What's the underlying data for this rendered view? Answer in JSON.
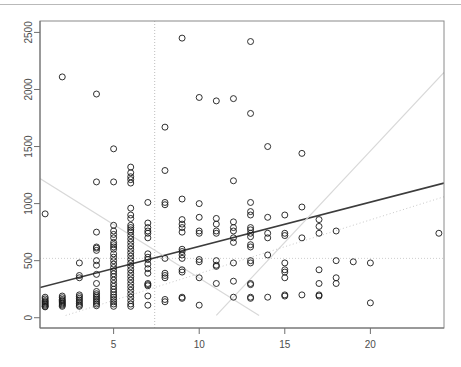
{
  "figure": {
    "kind": "scatter-plot",
    "background": "#ffffff",
    "top_separator_color": "#b9b9b9"
  },
  "chart_data": {
    "type": "scatter",
    "title": "",
    "subtitle": "",
    "xlabel": "",
    "ylabel": "",
    "xlim": [
      0.7,
      24.3
    ],
    "ylim": [
      -90,
      2600
    ],
    "xticks": [
      5,
      10,
      15,
      20
    ],
    "yticks": [
      0,
      500,
      1000,
      1500,
      2000,
      2500
    ],
    "xtick_labels": [
      "5",
      "10",
      "15",
      "20"
    ],
    "ytick_labels": [
      "0",
      "500",
      "1000",
      "1500",
      "2000",
      "2500"
    ],
    "ytick_label_rotation": -90,
    "grid": false,
    "legend": null,
    "marker": {
      "shape": "open-circle",
      "color": "#1a1a1a",
      "radius": 3.0
    },
    "annotations": [
      {
        "name": "vertical-reference-line",
        "kind": "vline",
        "x": 7.4,
        "style": "dotted",
        "color": "#bdbdbd"
      },
      {
        "name": "horizontal-reference-line",
        "kind": "hline",
        "y": 520,
        "style": "dotted",
        "color": "#cfcfcf"
      },
      {
        "name": "regression-line",
        "kind": "line",
        "x0": 0.7,
        "y0": 265,
        "x1": 24.3,
        "y1": 1180,
        "style": "solid",
        "color": "#3c3c3c",
        "width": 1.6
      },
      {
        "name": "upper-confidence-guide",
        "kind": "line",
        "x0": 11.0,
        "y0": 20,
        "x1": 24.3,
        "y1": 2150,
        "style": "solid",
        "color": "#d8d8d8",
        "width": 1.2
      },
      {
        "name": "lower-confidence-guide",
        "kind": "line",
        "x0": 0.7,
        "y0": 1220,
        "x1": 13.5,
        "y1": 20,
        "style": "solid",
        "color": "#d8d8d8",
        "width": 1.2
      },
      {
        "name": "diagonal-dotted-guide",
        "kind": "line",
        "x0": 2.2,
        "y0": 20,
        "x1": 24.3,
        "y1": 1060,
        "style": "dotted",
        "color": "#c9c9c9",
        "width": 1.0
      }
    ],
    "points": [
      [
        1.0,
        910
      ],
      [
        1.0,
        150
      ],
      [
        1.0,
        140
      ],
      [
        1.0,
        130
      ],
      [
        1.0,
        120
      ],
      [
        1.0,
        110
      ],
      [
        1.0,
        100
      ],
      [
        1.0,
        95
      ],
      [
        1.0,
        165
      ],
      [
        1.0,
        180
      ],
      [
        2.0,
        2110
      ],
      [
        2.0,
        175
      ],
      [
        2.0,
        160
      ],
      [
        2.0,
        150
      ],
      [
        2.0,
        140
      ],
      [
        2.0,
        130
      ],
      [
        2.0,
        120
      ],
      [
        2.0,
        110
      ],
      [
        2.0,
        100
      ],
      [
        2.0,
        190
      ],
      [
        3.0,
        480
      ],
      [
        3.0,
        370
      ],
      [
        3.0,
        350
      ],
      [
        3.0,
        200
      ],
      [
        3.0,
        185
      ],
      [
        3.0,
        170
      ],
      [
        3.0,
        155
      ],
      [
        3.0,
        140
      ],
      [
        3.0,
        125
      ],
      [
        3.0,
        110
      ],
      [
        3.0,
        100
      ],
      [
        4.0,
        1960
      ],
      [
        4.0,
        1190
      ],
      [
        4.0,
        750
      ],
      [
        4.0,
        620
      ],
      [
        4.0,
        610
      ],
      [
        4.0,
        590
      ],
      [
        4.0,
        500
      ],
      [
        4.0,
        460
      ],
      [
        4.0,
        380
      ],
      [
        4.0,
        300
      ],
      [
        4.0,
        230
      ],
      [
        4.0,
        210
      ],
      [
        4.0,
        195
      ],
      [
        4.0,
        180
      ],
      [
        4.0,
        165
      ],
      [
        4.0,
        150
      ],
      [
        4.0,
        135
      ],
      [
        4.0,
        120
      ],
      [
        4.0,
        105
      ],
      [
        5.0,
        1480
      ],
      [
        5.0,
        1190
      ],
      [
        5.0,
        810
      ],
      [
        5.0,
        760
      ],
      [
        5.0,
        730
      ],
      [
        5.0,
        700
      ],
      [
        5.0,
        660
      ],
      [
        5.0,
        640
      ],
      [
        5.0,
        620
      ],
      [
        5.0,
        600
      ],
      [
        5.0,
        560
      ],
      [
        5.0,
        530
      ],
      [
        5.0,
        500
      ],
      [
        5.0,
        470
      ],
      [
        5.0,
        440
      ],
      [
        5.0,
        410
      ],
      [
        5.0,
        385
      ],
      [
        5.0,
        360
      ],
      [
        5.0,
        330
      ],
      [
        5.0,
        300
      ],
      [
        5.0,
        275
      ],
      [
        5.0,
        250
      ],
      [
        5.0,
        225
      ],
      [
        5.0,
        200
      ],
      [
        5.0,
        180
      ],
      [
        5.0,
        160
      ],
      [
        5.0,
        140
      ],
      [
        5.0,
        120
      ],
      [
        5.0,
        100
      ],
      [
        6.0,
        1320
      ],
      [
        6.0,
        1270
      ],
      [
        6.0,
        1235
      ],
      [
        6.0,
        1210
      ],
      [
        6.0,
        1180
      ],
      [
        6.0,
        960
      ],
      [
        6.0,
        900
      ],
      [
        6.0,
        870
      ],
      [
        6.0,
        810
      ],
      [
        6.0,
        790
      ],
      [
        6.0,
        770
      ],
      [
        6.0,
        750
      ],
      [
        6.0,
        720
      ],
      [
        6.0,
        690
      ],
      [
        6.0,
        660
      ],
      [
        6.0,
        630
      ],
      [
        6.0,
        600
      ],
      [
        6.0,
        570
      ],
      [
        6.0,
        540
      ],
      [
        6.0,
        510
      ],
      [
        6.0,
        480
      ],
      [
        6.0,
        450
      ],
      [
        6.0,
        420
      ],
      [
        6.0,
        390
      ],
      [
        6.0,
        360
      ],
      [
        6.0,
        330
      ],
      [
        6.0,
        300
      ],
      [
        6.0,
        270
      ],
      [
        6.0,
        240
      ],
      [
        6.0,
        210
      ],
      [
        6.0,
        180
      ],
      [
        6.0,
        150
      ],
      [
        6.0,
        120
      ],
      [
        6.0,
        100
      ],
      [
        7.0,
        1010
      ],
      [
        7.0,
        830
      ],
      [
        7.0,
        790
      ],
      [
        7.0,
        760
      ],
      [
        7.0,
        740
      ],
      [
        7.0,
        700
      ],
      [
        7.0,
        560
      ],
      [
        7.0,
        530
      ],
      [
        7.0,
        510
      ],
      [
        7.0,
        470
      ],
      [
        7.0,
        430
      ],
      [
        7.0,
        390
      ],
      [
        7.0,
        300
      ],
      [
        7.0,
        290
      ],
      [
        7.0,
        280
      ],
      [
        7.0,
        190
      ],
      [
        7.0,
        110
      ],
      [
        8.0,
        1290
      ],
      [
        8.0,
        1670
      ],
      [
        8.0,
        1010
      ],
      [
        8.0,
        990
      ],
      [
        8.0,
        520
      ],
      [
        8.0,
        390
      ],
      [
        8.0,
        370
      ],
      [
        8.0,
        350
      ],
      [
        8.0,
        160
      ],
      [
        8.0,
        140
      ],
      [
        9.0,
        2450
      ],
      [
        9.0,
        1040
      ],
      [
        9.0,
        860
      ],
      [
        9.0,
        820
      ],
      [
        9.0,
        790
      ],
      [
        9.0,
        750
      ],
      [
        9.0,
        600
      ],
      [
        9.0,
        580
      ],
      [
        9.0,
        550
      ],
      [
        9.0,
        520
      ],
      [
        9.0,
        420
      ],
      [
        9.0,
        400
      ],
      [
        9.0,
        180
      ],
      [
        9.0,
        170
      ],
      [
        10.0,
        1930
      ],
      [
        10.0,
        880
      ],
      [
        10.0,
        760
      ],
      [
        10.0,
        740
      ],
      [
        10.0,
        1000
      ],
      [
        10.0,
        510
      ],
      [
        10.0,
        490
      ],
      [
        10.0,
        350
      ],
      [
        10.0,
        110
      ],
      [
        11.0,
        1900
      ],
      [
        11.0,
        870
      ],
      [
        11.0,
        820
      ],
      [
        11.0,
        760
      ],
      [
        11.0,
        740
      ],
      [
        11.0,
        500
      ],
      [
        11.0,
        460
      ],
      [
        11.0,
        450
      ],
      [
        11.0,
        300
      ],
      [
        12.0,
        1920
      ],
      [
        12.0,
        1200
      ],
      [
        12.0,
        840
      ],
      [
        12.0,
        790
      ],
      [
        12.0,
        760
      ],
      [
        12.0,
        700
      ],
      [
        12.0,
        660
      ],
      [
        12.0,
        480
      ],
      [
        12.0,
        320
      ],
      [
        12.0,
        180
      ],
      [
        13.0,
        2420
      ],
      [
        13.0,
        1790
      ],
      [
        13.0,
        1010
      ],
      [
        13.0,
        930
      ],
      [
        13.0,
        900
      ],
      [
        13.0,
        790
      ],
      [
        13.0,
        770
      ],
      [
        13.0,
        740
      ],
      [
        13.0,
        710
      ],
      [
        13.0,
        640
      ],
      [
        13.0,
        620
      ],
      [
        13.0,
        500
      ],
      [
        13.0,
        480
      ],
      [
        13.0,
        300
      ],
      [
        13.0,
        290
      ],
      [
        13.0,
        180
      ],
      [
        13.0,
        170
      ],
      [
        14.0,
        1500
      ],
      [
        14.0,
        880
      ],
      [
        14.0,
        740
      ],
      [
        14.0,
        700
      ],
      [
        14.0,
        550
      ],
      [
        14.0,
        180
      ],
      [
        15.0,
        900
      ],
      [
        15.0,
        740
      ],
      [
        15.0,
        720
      ],
      [
        15.0,
        480
      ],
      [
        15.0,
        420
      ],
      [
        15.0,
        400
      ],
      [
        15.0,
        350
      ],
      [
        15.0,
        200
      ],
      [
        15.0,
        190
      ],
      [
        16.0,
        1440
      ],
      [
        16.0,
        970
      ],
      [
        16.0,
        700
      ],
      [
        16.0,
        200
      ],
      [
        17.0,
        860
      ],
      [
        17.0,
        800
      ],
      [
        17.0,
        740
      ],
      [
        17.0,
        420
      ],
      [
        17.0,
        300
      ],
      [
        17.0,
        200
      ],
      [
        17.0,
        190
      ],
      [
        18.0,
        760
      ],
      [
        18.0,
        500
      ],
      [
        18.0,
        350
      ],
      [
        18.0,
        300
      ],
      [
        19.0,
        490
      ],
      [
        20.0,
        480
      ],
      [
        20.0,
        130
      ],
      [
        24.0,
        740
      ]
    ]
  }
}
